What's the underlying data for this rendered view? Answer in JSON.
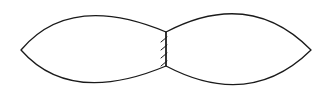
{
  "diagram": {
    "background": "#ffffff",
    "stroke_color": "#1a1a1a",
    "stroke_width": 1.3,
    "shapes": [
      {
        "name": "left-lens",
        "d": "M21,50 Q70,-8 166,32 L166,66 Q70,106 21,50 Z"
      },
      {
        "name": "right-lens",
        "d": "M166,32 Q250,-12 311,50 Q250,110 166,66"
      }
    ],
    "joint": {
      "name": "hatched-joint",
      "x": 166,
      "y1": 32,
      "y2": 66,
      "ticks": [
        {
          "x1": 161,
          "y1": 42,
          "x2": 167,
          "y2": 37
        },
        {
          "x1": 161,
          "y1": 50,
          "x2": 167,
          "y2": 45
        },
        {
          "x1": 161,
          "y1": 58,
          "x2": 167,
          "y2": 53
        },
        {
          "x1": 161,
          "y1": 66,
          "x2": 167,
          "y2": 61
        }
      ]
    }
  }
}
